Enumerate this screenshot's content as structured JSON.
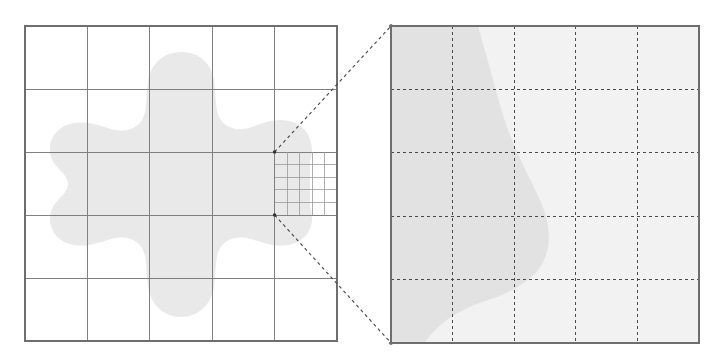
{
  "figure": {
    "type": "diagram",
    "background_color": "#ffffff",
    "domain_fill_color": "#e9e9e9",
    "domain_fill_color_dark": "#e2e2e2",
    "grid_line_color": "#808080",
    "border_color": "#6e6e6e",
    "dashed_line_color": "#555555",
    "connector_color": "#444444"
  },
  "left_panel": {
    "name": "coarse-grid-panel",
    "x": 25,
    "y": 26,
    "width": 312,
    "height": 315,
    "columns": 5,
    "rows": 5,
    "line_style": "solid",
    "grid_x": [
      25,
      87.4,
      149.8,
      212.2,
      274.6,
      337
    ],
    "grid_y": [
      26,
      89,
      152,
      215,
      278,
      341
    ],
    "shaded_region": {
      "name": "star-shaped-domain",
      "fill": "#e9e9e9",
      "description": "Four-lobed star/cross-shaped blob centered in the grid"
    },
    "refined_cell": {
      "name": "refined-cell",
      "col": 5,
      "row": 3,
      "x": 274.6,
      "y": 152,
      "width": 62.4,
      "height": 63,
      "sub_columns": 5,
      "sub_rows": 5,
      "sub_line_style": "solid-thin"
    }
  },
  "right_panel": {
    "name": "magnified-detail-panel",
    "x": 391,
    "y": 26,
    "width": 308,
    "height": 317,
    "columns": 5,
    "rows": 5,
    "line_style": "dashed",
    "grid_x": [
      391,
      452.6,
      514.2,
      575.8,
      637.4,
      699
    ],
    "grid_y": [
      26,
      89.4,
      152.8,
      216.2,
      279.6,
      343
    ],
    "shaded_region": {
      "name": "magnified-domain-boundary",
      "fill": "#e2e2e2",
      "description": "S-shaped boundary curve of the domain as seen inside the refined cell"
    }
  },
  "connectors": [
    {
      "name": "connector-top",
      "from_x": 274.6,
      "from_y": 152,
      "to_x": 391,
      "to_y": 26,
      "style": "dashed"
    },
    {
      "name": "connector-bottom",
      "from_x": 274.6,
      "from_y": 215,
      "to_x": 391,
      "to_y": 343,
      "style": "dashed"
    }
  ],
  "chart_data": {
    "type": "diagram",
    "title": "",
    "xlabel": "",
    "ylabel": "",
    "grid": true,
    "legend": "none",
    "left_grid_divisions": 5,
    "right_grid_divisions": 5,
    "refinement_factor": 5
  }
}
